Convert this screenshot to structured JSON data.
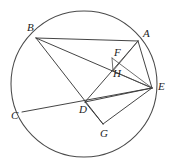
{
  "figure": {
    "name": "circle-geometry-figure",
    "background_color": "#ffffff",
    "stroke_color": "#3a3a3a",
    "label_color": "#1d1d1d",
    "circle": {
      "cx": 84,
      "cy": 84,
      "r": 73
    },
    "points": [
      {
        "id": "A",
        "label": "A",
        "x": 138,
        "y": 41,
        "label_x": 143,
        "label_y": 28
      },
      {
        "id": "B",
        "label": "B",
        "x": 36,
        "y": 38,
        "label_x": 27,
        "label_y": 22
      },
      {
        "id": "C",
        "label": "C",
        "x": 22,
        "y": 112,
        "label_x": 11,
        "label_y": 110
      },
      {
        "id": "D",
        "label": "D",
        "x": 85,
        "y": 102,
        "label_x": 79,
        "label_y": 104
      },
      {
        "id": "E",
        "label": "E",
        "x": 152,
        "y": 88,
        "label_x": 158,
        "label_y": 81
      },
      {
        "id": "F",
        "label": "F",
        "x": 112,
        "y": 58,
        "label_x": 114,
        "label_y": 47
      },
      {
        "id": "G",
        "label": "G",
        "x": 103,
        "y": 124,
        "label_x": 100,
        "label_y": 128
      },
      {
        "id": "H",
        "label": "H",
        "x": 113,
        "y": 71,
        "label_x": 113,
        "label_y": 68
      }
    ],
    "segments": [
      {
        "id": "BA",
        "from": "B",
        "to": "A",
        "kind": "chord"
      },
      {
        "id": "BE",
        "from": "B",
        "to": "E",
        "kind": "chord"
      },
      {
        "id": "BG",
        "from": "B",
        "to": "G",
        "kind": "chord"
      },
      {
        "id": "CE",
        "from": "C",
        "to": "E",
        "kind": "chord"
      },
      {
        "id": "AE",
        "from": "A",
        "to": "E",
        "kind": "chord"
      },
      {
        "id": "AD",
        "from": "A",
        "to": "D",
        "kind": "chord"
      },
      {
        "id": "AH",
        "from": "A",
        "to": "H",
        "kind": "thin"
      },
      {
        "id": "DE",
        "from": "D",
        "to": "E",
        "kind": "chord"
      },
      {
        "id": "DG",
        "from": "D",
        "to": "G",
        "kind": "chord"
      },
      {
        "id": "GE",
        "from": "G",
        "to": "E",
        "kind": "chord"
      },
      {
        "id": "FE",
        "from": "F",
        "to": "E",
        "kind": "thin"
      },
      {
        "id": "HE",
        "from": "H",
        "to": "E",
        "kind": "thin"
      },
      {
        "id": "FH",
        "from": "F",
        "to": "H",
        "kind": "thin"
      }
    ]
  }
}
